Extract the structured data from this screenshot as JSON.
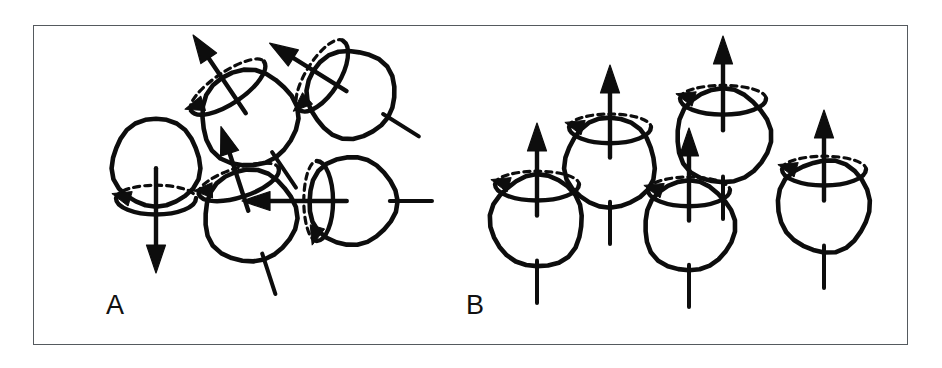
{
  "figure": {
    "kind": "nuclear-spin-orientation-diagram",
    "background_color": "#ffffff",
    "ink_color": "#0d0d0d",
    "frame_color": "#555a5e",
    "frame": {
      "x": 33,
      "y": 25,
      "width": 875,
      "height": 320
    },
    "panels": [
      {
        "id": "A",
        "label": "A",
        "label_x": 72,
        "label_y": 288,
        "description": "randomly oriented precessing nuclear spins",
        "spins": [
          {
            "name": "spin-a-1",
            "cx": 122,
            "cy": 137,
            "r": 44,
            "tilt_deg": 0,
            "arrow_direction": "down",
            "arrow_length": 96,
            "has_ring": true,
            "has_stub": false,
            "ring_rx": 40,
            "ring_ry": 13
          },
          {
            "name": "spin-a-2",
            "cx": 215,
            "cy": 92,
            "r": 48,
            "tilt_deg": -34,
            "arrow_direction": "up",
            "arrow_length": 86,
            "has_ring": true,
            "has_stub": true,
            "ring_rx": 44,
            "ring_ry": 14
          },
          {
            "name": "spin-a-3",
            "cx": 317,
            "cy": 68,
            "r": 44,
            "tilt_deg": -58,
            "arrow_direction": "up",
            "arrow_length": 82,
            "has_ring": true,
            "has_stub": true,
            "ring_rx": 41,
            "ring_ry": 15
          },
          {
            "name": "spin-a-4",
            "cx": 216,
            "cy": 190,
            "r": 46,
            "tilt_deg": -18,
            "arrow_direction": "up",
            "arrow_length": 80,
            "has_ring": true,
            "has_stub": true,
            "ring_rx": 42,
            "ring_ry": 13
          },
          {
            "name": "spin-a-5",
            "cx": 318,
            "cy": 175,
            "r": 44,
            "tilt_deg": -90,
            "arrow_direction": "left",
            "arrow_length": 96,
            "has_ring": true,
            "has_stub": true,
            "ring_rx": 40,
            "ring_ry": 13
          }
        ]
      },
      {
        "id": "B",
        "label": "B",
        "label_x": 432,
        "label_y": 288,
        "description": "nuclear spins aligned parallel along the external magnetic field",
        "spins": [
          {
            "name": "spin-b-1",
            "cx": 503,
            "cy": 195,
            "r": 46,
            "tilt_deg": 0,
            "arrow_direction": "up",
            "arrow_length": 84,
            "has_ring": true,
            "has_stub": true,
            "ring_rx": 42,
            "ring_ry": 13
          },
          {
            "name": "spin-b-2",
            "cx": 576,
            "cy": 137,
            "r": 45,
            "tilt_deg": 0,
            "arrow_direction": "up",
            "arrow_length": 84,
            "has_ring": true,
            "has_stub": true,
            "ring_rx": 41,
            "ring_ry": 13
          },
          {
            "name": "spin-b-3",
            "cx": 689,
            "cy": 110,
            "r": 47,
            "tilt_deg": 0,
            "arrow_direction": "up",
            "arrow_length": 86,
            "has_ring": true,
            "has_stub": true,
            "ring_rx": 43,
            "ring_ry": 13
          },
          {
            "name": "spin-b-4",
            "cx": 655,
            "cy": 200,
            "r": 45,
            "tilt_deg": 0,
            "arrow_direction": "up",
            "arrow_length": 84,
            "has_ring": true,
            "has_stub": true,
            "ring_rx": 41,
            "ring_ry": 13
          },
          {
            "name": "spin-b-5",
            "cx": 790,
            "cy": 180,
            "r": 46,
            "tilt_deg": 0,
            "arrow_direction": "up",
            "arrow_length": 82,
            "has_ring": true,
            "has_stub": true,
            "ring_rx": 42,
            "ring_ry": 13
          }
        ]
      }
    ]
  }
}
